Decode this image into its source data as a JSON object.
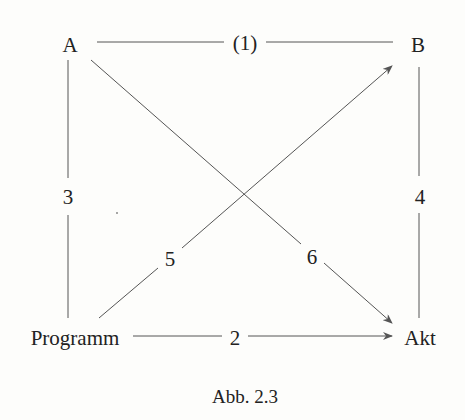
{
  "diagram": {
    "nodes": {
      "a": "A",
      "b": "B",
      "programm": "Programm",
      "akt": "Akt"
    },
    "edges": {
      "e1": "(1)",
      "e2": "2",
      "e3": "3",
      "e4": "4",
      "e5": "5",
      "e6": "6"
    },
    "caption": "Abb. 2.3",
    "line_color": "#555555",
    "text_color": "#222222"
  }
}
